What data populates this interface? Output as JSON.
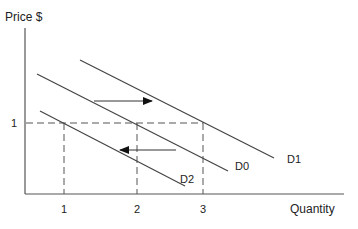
{
  "diagram": {
    "type": "demand-shift",
    "y_axis_label": "Price $",
    "x_axis_label": "Quantity",
    "price_tick": "1",
    "quantity_ticks": [
      "1",
      "2",
      "3"
    ],
    "curves": [
      {
        "name": "D0",
        "label": "D0"
      },
      {
        "name": "D1",
        "label": "D1"
      },
      {
        "name": "D2",
        "label": "D2"
      }
    ],
    "arrows": [
      {
        "direction": "right",
        "meaning": "increase in demand D0 to D1"
      },
      {
        "direction": "left",
        "meaning": "decrease in demand D0 to D2"
      }
    ],
    "colors": {
      "line": "#333333",
      "background": "#ffffff"
    }
  }
}
